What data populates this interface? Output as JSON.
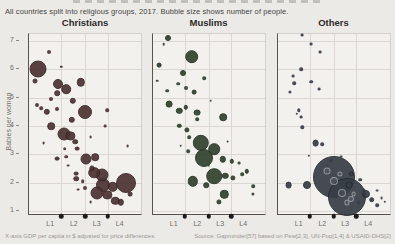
{
  "chart_data": {
    "type": "scatter",
    "subtitle": "All countries split into religious groups, 2017. Bubble size shows number of people.",
    "ylabel": "Babies per woman",
    "footer_left": "X-axis GDP per capita in $ adjusted for price differences.",
    "footer_right": "Source: Gapminder[57] based on Pew[2,3], UN-Pop[1,4] & USAID-DHS[2]",
    "y_ticks": [
      7,
      6,
      5,
      4,
      3,
      2,
      1
    ],
    "ylim": [
      0.82,
      7.25
    ],
    "x_tick_labels": [
      "L1",
      "L2",
      "L3",
      "L4"
    ],
    "x_label_fractions": [
      0.19,
      0.4,
      0.605,
      0.81
    ],
    "x_dot_fractions": [
      0.29,
      0.5,
      0.705
    ],
    "x_axis_note": "income levels L1-L4, dots mark level boundaries",
    "bubble_note": "points are [x_fraction_of_panel, babies_per_woman, radius_px, is_ring]",
    "panels": [
      {
        "title": "Christians",
        "color": "#4d3133",
        "border": "#3a2426",
        "points": [
          [
            0.08,
            6.0,
            8.5
          ],
          [
            0.05,
            5.6,
            2.5
          ],
          [
            0.18,
            6.6,
            2
          ],
          [
            0.29,
            6.1,
            1.2
          ],
          [
            0.26,
            5.5,
            5
          ],
          [
            0.33,
            5.3,
            4.8
          ],
          [
            0.46,
            5.55,
            4.2
          ],
          [
            0.25,
            5.15,
            2.8
          ],
          [
            0.2,
            4.95,
            2
          ],
          [
            0.39,
            4.9,
            3.2
          ],
          [
            0.07,
            4.75,
            2
          ],
          [
            0.16,
            4.5,
            3.2
          ],
          [
            0.11,
            4.62,
            1.8
          ],
          [
            0.25,
            4.6,
            2
          ],
          [
            0.5,
            4.48,
            7
          ],
          [
            0.7,
            4.55,
            1.8
          ],
          [
            0.38,
            4.22,
            3.2
          ],
          [
            0.2,
            4.0,
            3.8
          ],
          [
            0.31,
            3.7,
            6.5
          ],
          [
            0.37,
            3.65,
            4.6
          ],
          [
            0.41,
            3.45,
            2.8
          ],
          [
            0.32,
            3.2,
            1.8
          ],
          [
            0.43,
            3.2,
            2.4
          ],
          [
            0.13,
            3.4,
            1.4
          ],
          [
            0.55,
            3.6,
            1.4
          ],
          [
            0.88,
            3.3,
            1.4
          ],
          [
            0.68,
            4.0,
            1.4
          ],
          [
            0.25,
            2.85,
            2.4
          ],
          [
            0.33,
            2.92,
            1.8
          ],
          [
            0.51,
            2.82,
            5.5
          ],
          [
            0.59,
            2.9,
            3.8
          ],
          [
            0.56,
            2.5,
            2.6
          ],
          [
            0.35,
            2.6,
            1.4
          ],
          [
            0.42,
            2.32,
            2.4
          ],
          [
            0.42,
            2.14,
            2.8
          ],
          [
            0.58,
            2.35,
            5.8
          ],
          [
            0.65,
            2.27,
            6.5
          ],
          [
            0.48,
            2.05,
            1.8
          ],
          [
            0.5,
            1.82,
            2
          ],
          [
            0.87,
            2.0,
            10
          ],
          [
            0.66,
            1.9,
            7
          ],
          [
            0.75,
            1.85,
            5.2
          ],
          [
            0.61,
            1.62,
            6.5
          ],
          [
            0.7,
            1.56,
            4.6
          ],
          [
            0.77,
            1.35,
            4.2
          ],
          [
            0.82,
            1.3,
            3.2
          ],
          [
            0.9,
            1.6,
            2.4
          ],
          [
            0.55,
            1.3,
            1.4
          ],
          [
            0.44,
            1.75,
            1.4
          ]
        ]
      },
      {
        "title": "Muslims",
        "color": "#31412f",
        "border": "#233020",
        "points": [
          [
            0.14,
            7.12,
            3
          ],
          [
            0.1,
            6.9,
            1.3
          ],
          [
            0.35,
            6.45,
            6.8
          ],
          [
            0.06,
            6.15,
            2.4
          ],
          [
            0.27,
            5.88,
            3
          ],
          [
            0.46,
            5.68,
            1.8
          ],
          [
            0.23,
            5.5,
            1.8
          ],
          [
            0.3,
            5.35,
            2
          ],
          [
            0.37,
            5.2,
            2.4
          ],
          [
            0.13,
            5.25,
            1.8
          ],
          [
            0.04,
            5.6,
            1.3
          ],
          [
            0.52,
            4.9,
            1.3
          ],
          [
            0.15,
            4.76,
            3.4
          ],
          [
            0.24,
            4.53,
            3.2
          ],
          [
            0.3,
            4.66,
            2.2
          ],
          [
            0.4,
            4.47,
            3.4
          ],
          [
            0.63,
            4.3,
            3.8
          ],
          [
            0.4,
            4.24,
            1.8
          ],
          [
            0.24,
            4.0,
            2.2
          ],
          [
            0.31,
            3.85,
            2.6
          ],
          [
            0.33,
            3.6,
            1.8
          ],
          [
            0.43,
            3.4,
            8.2
          ],
          [
            0.55,
            3.17,
            5.8
          ],
          [
            0.32,
            3.1,
            1.8
          ],
          [
            0.25,
            3.3,
            1.3
          ],
          [
            0.67,
            3.45,
            1.4
          ],
          [
            0.63,
            2.82,
            3.2
          ],
          [
            0.46,
            2.86,
            9
          ],
          [
            0.71,
            2.75,
            2.2
          ],
          [
            0.5,
            2.6,
            1.4
          ],
          [
            0.77,
            2.7,
            1.4
          ],
          [
            0.8,
            2.3,
            1.8
          ],
          [
            0.36,
            2.05,
            5.2
          ],
          [
            0.55,
            2.23,
            7.8
          ],
          [
            0.65,
            2.23,
            3.2
          ],
          [
            0.72,
            2.18,
            2.6
          ],
          [
            0.84,
            2.4,
            2.2
          ],
          [
            0.48,
            1.9,
            2.8
          ],
          [
            0.64,
            1.58,
            4.2
          ],
          [
            0.9,
            1.87,
            1.8
          ],
          [
            0.9,
            1.6,
            1.6
          ],
          [
            0.59,
            1.33,
            2.6
          ]
        ]
      },
      {
        "title": "Others",
        "color": "#383e46",
        "border": "#262b33",
        "points": [
          [
            0.5,
            2.2,
            21
          ],
          [
            0.62,
            1.5,
            19
          ],
          [
            0.44,
            2.4,
            3.5,
            1
          ],
          [
            0.5,
            2.05,
            4,
            1
          ],
          [
            0.56,
            2.3,
            2.6,
            1
          ],
          [
            0.58,
            1.62,
            4,
            1
          ],
          [
            0.66,
            1.42,
            3,
            1
          ],
          [
            0.62,
            1.3,
            2.6,
            1
          ],
          [
            0.68,
            1.6,
            2.4,
            1
          ],
          [
            0.22,
            7.2,
            1.4
          ],
          [
            0.3,
            6.9,
            1.4
          ],
          [
            0.38,
            6.6,
            1.4
          ],
          [
            0.21,
            6.0,
            1.8
          ],
          [
            0.14,
            5.76,
            1.4
          ],
          [
            0.15,
            5.52,
            1.8
          ],
          [
            0.3,
            5.56,
            1.8
          ],
          [
            0.37,
            5.3,
            1.4
          ],
          [
            0.11,
            5.2,
            1.6
          ],
          [
            0.19,
            4.55,
            1.7
          ],
          [
            0.21,
            4.3,
            1.4
          ],
          [
            0.17,
            4.42,
            1.2
          ],
          [
            0.22,
            3.95,
            1.7
          ],
          [
            0.34,
            3.4,
            3.4
          ],
          [
            0.4,
            3.35,
            1.8
          ],
          [
            0.28,
            2.95,
            1.2
          ],
          [
            0.57,
            2.92,
            1.4
          ],
          [
            0.48,
            2.8,
            1.8
          ],
          [
            0.44,
            2.6,
            1.4
          ],
          [
            0.66,
            2.3,
            2.2
          ],
          [
            0.74,
            2.1,
            1.8
          ],
          [
            0.1,
            1.9,
            3.4
          ],
          [
            0.26,
            1.92,
            4
          ],
          [
            0.64,
            1.9,
            3.4
          ],
          [
            0.89,
            1.72,
            1.4
          ],
          [
            0.77,
            1.75,
            1.6
          ],
          [
            0.79,
            1.58,
            4
          ],
          [
            0.84,
            1.4,
            2.8
          ],
          [
            0.73,
            1.3,
            1.6
          ],
          [
            0.89,
            1.2,
            1.8
          ],
          [
            0.93,
            1.45,
            1.4
          ],
          [
            0.96,
            1.32,
            1.2
          ]
        ]
      }
    ]
  }
}
